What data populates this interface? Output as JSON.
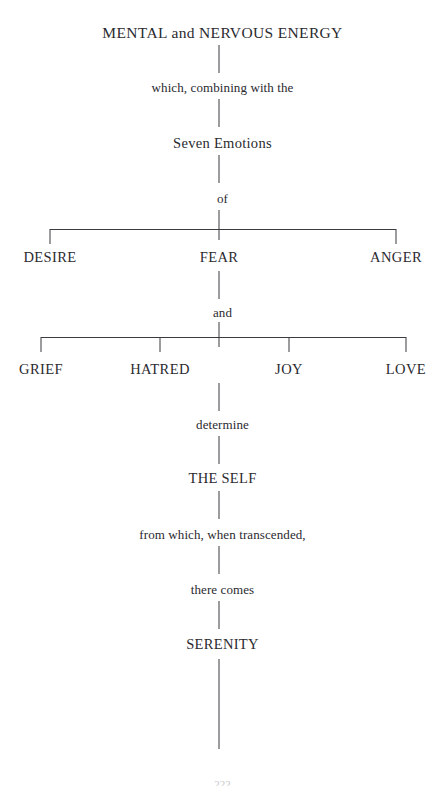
{
  "diagram": {
    "title": "MENTAL and NERVOUS ENERGY",
    "type": "flow-tree",
    "orientation": "vertical",
    "line_color": "#3a3a40",
    "text_color": "#2a2a2f",
    "background_color": "#ffffff",
    "nodes": {
      "root": "MENTAL and NERVOUS ENERGY",
      "connector_1": "which, combining with the",
      "seven_emotions": "Seven Emotions",
      "connector_of": "of",
      "branch_a_left": "DESIRE",
      "branch_a_center": "FEAR",
      "branch_a_right": "ANGER",
      "connector_and": "and",
      "branch_b_1": "GRIEF",
      "branch_b_2": "HATRED",
      "branch_b_3": "JOY",
      "branch_b_4": "LOVE",
      "connector_determine": "determine",
      "the_self": "THE SELF",
      "connector_from_which": "from which, when transcended,",
      "connector_there_comes": "there comes",
      "serenity": "SERENITY"
    },
    "page_number": "222"
  }
}
